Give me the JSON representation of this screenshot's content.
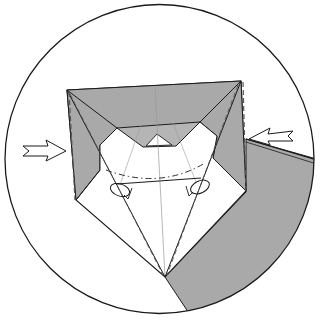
{
  "diagram": {
    "type": "origami-folding-step",
    "colors": {
      "background": "#ffffff",
      "outline": "#1a1a1a",
      "shade": "#a9a9a9",
      "inner_shade": "#b5b5b5",
      "guide": "#9a9a9a"
    },
    "elements": {
      "circle_frame": "detail-circle",
      "left_arrow": "push-arrow-left",
      "right_arrow": "push-arrow-right",
      "fold_line": "valley-fold-dash-dot",
      "loops": "pleat-loop-symbols"
    }
  }
}
